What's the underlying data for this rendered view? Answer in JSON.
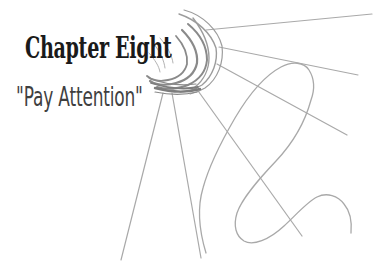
{
  "page": {
    "background": "#ffffff",
    "chapter_title": "Chapter Eight",
    "chapter_subtitle": "\"Pay Attention\"",
    "title_color": "#1a1a1a",
    "subtitle_color": "#3f3f3f"
  },
  "sketch": {
    "name": "scribbled-sun-with-rays",
    "colors": {
      "line": "#a9a9a9",
      "outer": "#9c9c9c",
      "mid": "#8a8a8a",
      "dark": "#7d7d7d",
      "light": "#b3b3b3"
    }
  }
}
